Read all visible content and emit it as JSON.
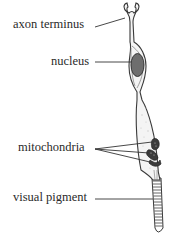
{
  "figure": {
    "labels": [
      {
        "id": "axon-terminus",
        "text": "axon terminus"
      },
      {
        "id": "nucleus",
        "text": "nucleus"
      },
      {
        "id": "mitochondria",
        "text": "mitochondria"
      },
      {
        "id": "visual-pigment",
        "text": "visual pigment"
      }
    ],
    "colors": {
      "outline": "#3a3a3a",
      "cell_fill": "#f2f2f2",
      "nucleus_fill": "#6e6e6e",
      "mitochondria_fill": "#3c3c3c",
      "leader_line": "#333333",
      "text": "#2a2a2a"
    }
  }
}
